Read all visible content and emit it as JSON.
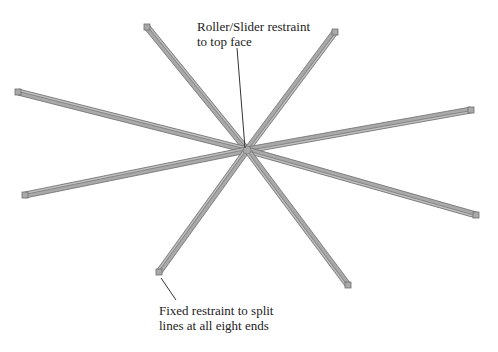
{
  "diagram": {
    "colors": {
      "beam_fill": "#a9a9a9",
      "beam_edge": "#6e6e6e",
      "beam_highlight": "#d0d0d0",
      "leader": "#333333",
      "text": "#222222",
      "background": "#ffffff"
    },
    "hub": {
      "x": 247,
      "y": 150
    },
    "beams": [
      {
        "id": "beam-top-left",
        "end": {
          "x": 147,
          "y": 27
        }
      },
      {
        "id": "beam-top-right",
        "end": {
          "x": 335,
          "y": 32
        }
      },
      {
        "id": "beam-left-upper",
        "end": {
          "x": 18,
          "y": 92
        }
      },
      {
        "id": "beam-left-lower",
        "end": {
          "x": 25,
          "y": 195
        }
      },
      {
        "id": "beam-right-upper",
        "end": {
          "x": 471,
          "y": 110
        }
      },
      {
        "id": "beam-right-lower",
        "end": {
          "x": 476,
          "y": 215
        }
      },
      {
        "id": "beam-bottom-left",
        "end": {
          "x": 159,
          "y": 272
        }
      },
      {
        "id": "beam-bottom-right",
        "end": {
          "x": 348,
          "y": 285
        }
      }
    ],
    "annotations": [
      {
        "id": "roller-slider-annotation",
        "lines": [
          "Roller/Slider restraint",
          "to top face"
        ],
        "text_pos": {
          "x": 197,
          "y": 19
        },
        "leader": {
          "x1": 237,
          "y1": 48,
          "x2": 245,
          "y2": 148
        }
      },
      {
        "id": "fixed-restraint-annotation",
        "lines": [
          "Fixed restraint to split",
          "lines at all eight ends"
        ],
        "text_pos": {
          "x": 159,
          "y": 303
        },
        "leader": {
          "x1": 161,
          "y1": 278,
          "x2": 176,
          "y2": 300
        }
      }
    ]
  }
}
